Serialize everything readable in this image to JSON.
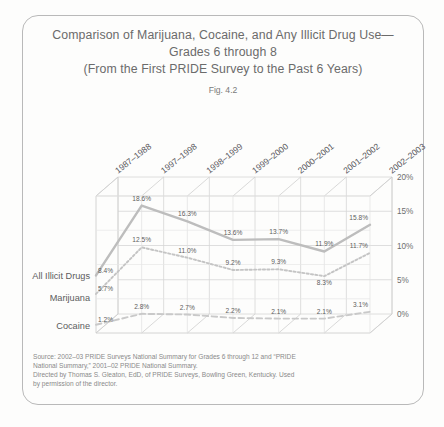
{
  "figure": {
    "title_lines": [
      "Comparison of Marijuana, Cocaine, and Any Illicit Drug Use—",
      "Grades 6 through 8",
      "(From the First PRIDE Survey to the Past 6 Years)"
    ],
    "fig_number": "Fig. 4.2",
    "source_lines": [
      "Source: 2002–03 PRIDE Surveys National Summary for Grades 6 through 12 and “PRIDE",
      "National Summary,” 2001–02 PRIDE National Summary.",
      "Directed by Thomas S. Gleaton, EdD, of PRIDE Surveys, Bowling Green, Kentucky. Used",
      "by permission of the director."
    ]
  },
  "chart_data": {
    "type": "line",
    "xlabel": "",
    "ylabel": "",
    "categories": [
      "1987–1988",
      "1997–1998",
      "1998–1999",
      "1999–2000",
      "2000–2001",
      "2001–2002",
      "2002–2003"
    ],
    "ylim": [
      0,
      20
    ],
    "yticks": [
      0,
      5,
      10,
      15,
      20
    ],
    "ytick_labels": [
      "0%",
      "5%",
      "10%",
      "15%",
      "20%"
    ],
    "grid": true,
    "legend_position": "left-inline",
    "series": [
      {
        "name": "All Illicit Drugs",
        "style": "solid",
        "color": "#bdbdbd",
        "values": [
          8.4,
          18.6,
          16.3,
          13.6,
          13.7,
          11.9,
          15.8
        ],
        "labels": [
          "8.4%",
          "18.6%",
          "16.3%",
          "13.6%",
          "13.7%",
          "11.9%",
          "15.8%"
        ]
      },
      {
        "name": "Marijuana",
        "style": "dotted",
        "color": "#c4c4c4",
        "values": [
          5.7,
          12.5,
          11.0,
          9.2,
          9.3,
          8.3,
          11.7
        ],
        "labels": [
          "5.7%",
          "12.5%",
          "11.0%",
          "9.2%",
          "9.3%",
          "8.3%",
          "11.7%"
        ]
      },
      {
        "name": "Cocaine",
        "style": "dashed",
        "color": "#c9c9c9",
        "values": [
          1.2,
          2.8,
          2.7,
          2.2,
          2.1,
          2.1,
          3.1
        ],
        "labels": [
          "1.2%",
          "2.8%",
          "2.7%",
          "2.2%",
          "2.1%",
          "2.1%",
          "3.1%"
        ]
      }
    ]
  }
}
